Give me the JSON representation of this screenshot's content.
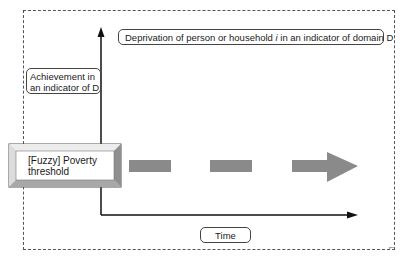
{
  "diagram": {
    "top_label": "Deprivation of person or household i in an indicator of domain D",
    "y_axis_label": "Achievement in an indicator of D",
    "x_axis_label": "Time",
    "threshold_label_line1": "[Fuzzy] Poverty",
    "threshold_label_line2": "threshold",
    "colors": {
      "axis": "#111111",
      "dashed_arrow": "#8a8a8a",
      "bevel_light": "#e8e8e8",
      "bevel_dark": "#9a9a9a",
      "frame": "#555555"
    }
  }
}
